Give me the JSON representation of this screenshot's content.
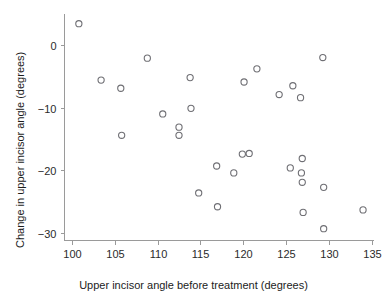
{
  "chart_data": {
    "type": "scatter",
    "title": "",
    "xlabel": "Upper incisor angle before treatment (degrees)",
    "ylabel": "Change in upper incisor angle (degrees)",
    "xlim": [
      98.0,
      136.5
    ],
    "ylim": [
      -32.0,
      5.5
    ],
    "xticks": [
      100,
      105,
      110,
      115,
      120,
      125,
      130,
      135
    ],
    "yticks": [
      0,
      -10,
      -20,
      -30
    ],
    "xtick_labels": [
      "100",
      "105",
      "110",
      "115",
      "120",
      "125",
      "130",
      "135"
    ],
    "ytick_labels": [
      "0",
      "−10",
      "−20",
      "−30"
    ],
    "grid": false,
    "legend": null,
    "marker": {
      "shape": "circle-open",
      "stroke": "#6f6f74",
      "fill": "none",
      "radius_px": 3.1
    },
    "series": [
      {
        "name": "patients",
        "points": [
          {
            "x": 100.8,
            "y": 3.4
          },
          {
            "x": 103.4,
            "y": -5.6
          },
          {
            "x": 105.7,
            "y": -6.9
          },
          {
            "x": 105.8,
            "y": -14.4
          },
          {
            "x": 108.8,
            "y": -2.1
          },
          {
            "x": 110.6,
            "y": -11.0
          },
          {
            "x": 112.5,
            "y": -13.1
          },
          {
            "x": 112.5,
            "y": -14.4
          },
          {
            "x": 113.8,
            "y": -5.2
          },
          {
            "x": 113.9,
            "y": -10.1
          },
          {
            "x": 114.8,
            "y": -23.6
          },
          {
            "x": 116.9,
            "y": -19.3
          },
          {
            "x": 117.0,
            "y": -25.8
          },
          {
            "x": 118.9,
            "y": -20.4
          },
          {
            "x": 119.9,
            "y": -17.4
          },
          {
            "x": 120.1,
            "y": -5.9
          },
          {
            "x": 120.7,
            "y": -17.3
          },
          {
            "x": 121.6,
            "y": -3.8
          },
          {
            "x": 124.2,
            "y": -7.9
          },
          {
            "x": 125.5,
            "y": -19.6
          },
          {
            "x": 125.8,
            "y": -6.5
          },
          {
            "x": 126.7,
            "y": -8.4
          },
          {
            "x": 126.8,
            "y": -20.4
          },
          {
            "x": 126.9,
            "y": -18.1
          },
          {
            "x": 126.9,
            "y": -21.9
          },
          {
            "x": 127.0,
            "y": -26.7
          },
          {
            "x": 129.3,
            "y": -2.0
          },
          {
            "x": 129.4,
            "y": -22.7
          },
          {
            "x": 129.4,
            "y": -29.3
          },
          {
            "x": 134.0,
            "y": -26.3
          }
        ]
      }
    ]
  },
  "figure": {
    "background": "#ffffff",
    "axis_color": "#9a9a9a",
    "text_color": "#1c1c1c"
  }
}
